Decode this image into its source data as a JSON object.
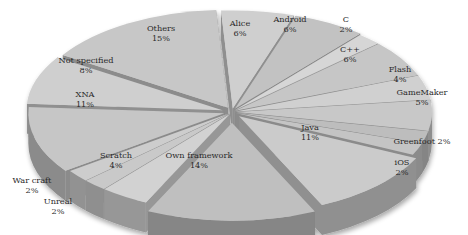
{
  "chart_data": {
    "type": "pie",
    "style": "3d-exploded",
    "title": "",
    "start_label": "Alice",
    "direction": "clockwise",
    "slices": [
      {
        "label": "Alice",
        "value": 6,
        "pct_label": "6%"
      },
      {
        "label": "Android",
        "value": 6,
        "pct_label": "6%"
      },
      {
        "label": "C",
        "value": 2,
        "pct_label": "2%"
      },
      {
        "label": "C++",
        "value": 6,
        "pct_label": "6%"
      },
      {
        "label": "Flash",
        "value": 4,
        "pct_label": "4%"
      },
      {
        "label": "GameMaker",
        "value": 5,
        "pct_label": "5%"
      },
      {
        "label": "Greenfoot",
        "value": 2,
        "pct_label": "2%"
      },
      {
        "label": "iOS",
        "value": 2,
        "pct_label": "2%"
      },
      {
        "label": "Java",
        "value": 11,
        "pct_label": "11%"
      },
      {
        "label": "Own framework",
        "value": 14,
        "pct_label": "14%"
      },
      {
        "label": "Scratch",
        "value": 4,
        "pct_label": "4%"
      },
      {
        "label": "Unreal",
        "value": 2,
        "pct_label": "2%"
      },
      {
        "label": "War craft",
        "value": 2,
        "pct_label": "2%"
      },
      {
        "label": "XNA",
        "value": 11,
        "pct_label": "11%"
      },
      {
        "label": "Not specified",
        "value": 8,
        "pct_label": "8%"
      },
      {
        "label": "Others",
        "value": 15,
        "pct_label": "15%"
      }
    ],
    "legend": "none (labels on slices)",
    "colors": {
      "top": "#c9c9c9",
      "side": "#8e8e8e",
      "label": "#2a2a2a"
    }
  }
}
